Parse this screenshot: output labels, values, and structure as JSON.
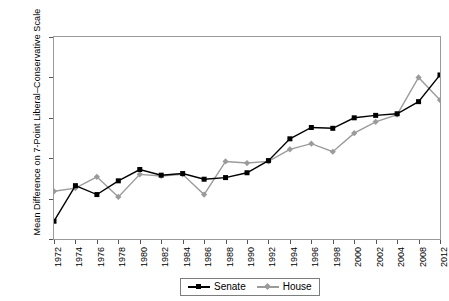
{
  "chart_data": {
    "type": "line",
    "title": "",
    "xlabel": "",
    "ylabel": "Mean Difference on 7-Point Liberal–Conservative Scale",
    "categories": [
      "1972",
      "1974",
      "1976",
      "1978",
      "1980",
      "1982",
      "1984",
      "1986",
      "1988",
      "1990",
      "1992",
      "1994",
      "1996",
      "1998",
      "2000",
      "2002",
      "2004",
      "2008",
      "2012"
    ],
    "ylim": [
      0,
      2.5
    ],
    "yticks": [
      "0",
      "0.5",
      "1",
      "1.5",
      "2",
      "2.5"
    ],
    "ytick_values": [
      0,
      0.5,
      1,
      1.5,
      2,
      2.5
    ],
    "grid": false,
    "legend_position": "bottom",
    "series": [
      {
        "name": "Senate",
        "color": "#000000",
        "marker": "square",
        "values": [
          0.22,
          0.66,
          0.55,
          0.72,
          0.86,
          0.79,
          0.81,
          0.74,
          0.76,
          0.82,
          0.97,
          1.24,
          1.38,
          1.37,
          1.5,
          1.53,
          1.55,
          1.7,
          2.03
        ]
      },
      {
        "name": "House",
        "color": "#9b9b9b",
        "marker": "diamond",
        "values": [
          0.59,
          0.63,
          0.77,
          0.52,
          0.8,
          0.78,
          0.8,
          0.55,
          0.96,
          0.94,
          0.96,
          1.11,
          1.18,
          1.08,
          1.31,
          1.45,
          1.54,
          2.0,
          1.72
        ]
      }
    ]
  },
  "legend": {
    "items": [
      {
        "label": "Senate"
      },
      {
        "label": "House"
      }
    ]
  }
}
